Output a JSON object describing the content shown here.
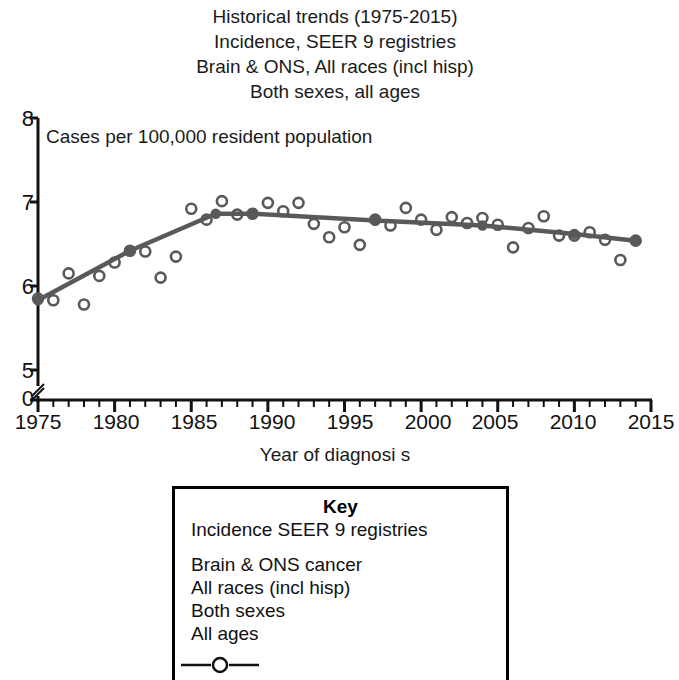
{
  "title": {
    "line1": "Historical trends (1975-2015)",
    "line2": "Incidence, SEER 9 registries",
    "line3": "Brain & ONS, All races (incl hisp)",
    "line4": "Both sexes, all ages"
  },
  "plot_note": "Cases per 100,000 resident population",
  "axes": {
    "xlabel": "Year of diagnosi s",
    "ytick_labels": [
      "8",
      "7",
      "6",
      "5",
      "0"
    ],
    "xtick_labels": [
      "1975",
      "1980",
      "1985",
      "1990",
      "1995",
      "2000",
      "2005",
      "2010",
      "2015"
    ]
  },
  "key": {
    "title": "Key",
    "line1": "Incidence SEER 9 registries",
    "line2": "Brain & ONS cancer",
    "line3": "All races (incl hisp)",
    "line4": "Both sexes",
    "line5": "All ages",
    "symbol": "line-with-circle-marker"
  },
  "colors": {
    "line": "#595959",
    "marker_stroke": "#595959",
    "axis": "#111111",
    "text": "#111111",
    "background": "#ffffff"
  },
  "chart_data": {
    "type": "line",
    "xlabel": "Year of diagnosi s",
    "ylabel": "Cases per 100,000 resident population",
    "xlim": [
      1975,
      2015
    ],
    "ylim": [
      5,
      8
    ],
    "y_axis_break": true,
    "y_break_below": 5,
    "grid": false,
    "legend": "Key box below plot",
    "x": [
      1975,
      1976,
      1977,
      1978,
      1979,
      1980,
      1981,
      1982,
      1983,
      1984,
      1985,
      1986,
      1987,
      1988,
      1989,
      1990,
      1991,
      1992,
      1993,
      1994,
      1995,
      1996,
      1997,
      1998,
      1999,
      2000,
      2001,
      2002,
      2003,
      2004,
      2005,
      2006,
      2007,
      2008,
      2009,
      2010,
      2011,
      2012,
      2013,
      2014
    ],
    "series": [
      {
        "name": "Observed incidence rate",
        "marker": "open circle",
        "values": [
          5.85,
          5.83,
          6.15,
          5.78,
          6.12,
          6.28,
          6.42,
          6.41,
          6.1,
          6.35,
          6.92,
          6.79,
          7.01,
          6.85,
          6.86,
          6.99,
          6.89,
          6.99,
          6.74,
          6.58,
          6.7,
          6.49,
          6.79,
          6.72,
          6.93,
          6.79,
          6.67,
          6.82,
          6.75,
          6.81,
          6.73,
          6.46,
          6.69,
          6.83,
          6.6,
          6.6,
          6.64,
          6.55,
          6.31,
          6.54
        ]
      },
      {
        "name": "Joinpoint fitted trend",
        "marker": "filled circle at joinpoints",
        "joinpoints": [
          {
            "year": 1975,
            "value": 5.83
          },
          {
            "year": 1981,
            "value": 6.42
          },
          {
            "year": 1986.6,
            "value": 6.86
          },
          {
            "year": 1989,
            "value": 6.86
          },
          {
            "year": 1997,
            "value": 6.78
          },
          {
            "year": 2004,
            "value": 6.72
          },
          {
            "year": 2010,
            "value": 6.62
          },
          {
            "year": 2014,
            "value": 6.54
          }
        ]
      }
    ]
  }
}
